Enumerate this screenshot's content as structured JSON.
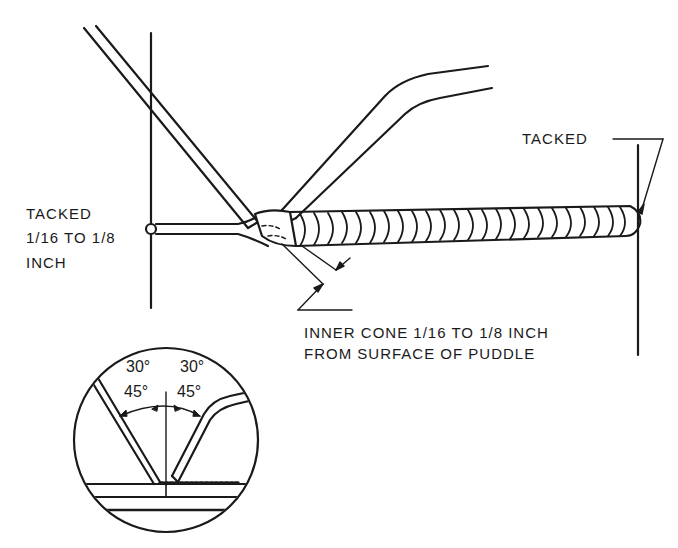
{
  "diagram": {
    "labels": {
      "tacked_left_line1": "TACKED",
      "tacked_left_line2": "1/16 TO 1/8",
      "tacked_left_line3": "INCH",
      "tacked_right": "TACKED",
      "inner_cone_line1": "INNER CONE 1/16 TO 1/8 INCH",
      "inner_cone_line2": "FROM SURFACE OF PUDDLE"
    },
    "inset": {
      "rod_angle_top": "30°",
      "rod_angle_bottom": "45°",
      "torch_angle_top": "30°",
      "torch_angle_bottom": "45°"
    },
    "colors": {
      "ink": "#1a1a1a",
      "background": "#ffffff"
    }
  }
}
